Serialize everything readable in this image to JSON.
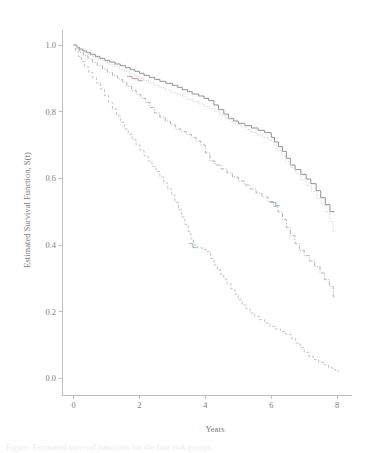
{
  "figure": {
    "background_color": "#ffffff",
    "axis_color": "#b9b9b9",
    "text_color": "#7a7a7a"
  },
  "caption": {
    "partial_text": "Figure. Estimated survival functions for the four risk groups."
  },
  "chart_data": {
    "type": "line",
    "title": "",
    "subtitle": "",
    "xlabel": "Years",
    "ylabel": "Estimated Survival Function, S(t)",
    "xlim": [
      -0.35,
      8.45
    ],
    "ylim": [
      -0.035,
      1.045
    ],
    "xticks": [
      0,
      2,
      4,
      6,
      8
    ],
    "xticklabels": [
      "0",
      "2",
      "4",
      "6",
      "8"
    ],
    "yticks": [
      0.0,
      0.2,
      0.4,
      0.6,
      0.8,
      1.0
    ],
    "yticklabels": [
      "0.0",
      "0.2",
      "0.4",
      "0.6",
      "0.8",
      "1.0"
    ],
    "grid": false,
    "legend": "none",
    "series": [
      {
        "name": "Group 1 (lowest risk)",
        "style": "solid",
        "color": "#8c8c8c",
        "width": 0.95,
        "dasharray": "none",
        "final_value": 0.5,
        "points": [
          [
            0.0,
            1.0
          ],
          [
            0.1,
            0.993
          ],
          [
            0.18,
            0.988
          ],
          [
            0.28,
            0.982
          ],
          [
            0.4,
            0.977
          ],
          [
            0.52,
            0.972
          ],
          [
            0.66,
            0.966
          ],
          [
            0.8,
            0.96
          ],
          [
            0.95,
            0.954
          ],
          [
            1.1,
            0.949
          ],
          [
            1.26,
            0.943
          ],
          [
            1.42,
            0.938
          ],
          [
            1.58,
            0.932
          ],
          [
            1.72,
            0.926
          ],
          [
            1.86,
            0.921
          ],
          [
            2.0,
            0.915
          ],
          [
            2.14,
            0.909
          ],
          [
            2.3,
            0.903
          ],
          [
            2.46,
            0.897
          ],
          [
            2.62,
            0.891
          ],
          [
            2.8,
            0.885
          ],
          [
            3.0,
            0.879
          ],
          [
            3.16,
            0.873
          ],
          [
            3.3,
            0.866
          ],
          [
            3.46,
            0.86
          ],
          [
            3.6,
            0.853
          ],
          [
            3.8,
            0.847
          ],
          [
            3.96,
            0.84
          ],
          [
            4.1,
            0.833
          ],
          [
            4.26,
            0.82
          ],
          [
            4.4,
            0.806
          ],
          [
            4.56,
            0.793
          ],
          [
            4.7,
            0.779
          ],
          [
            4.86,
            0.772
          ],
          [
            5.0,
            0.765
          ],
          [
            5.2,
            0.758
          ],
          [
            5.4,
            0.751
          ],
          [
            5.6,
            0.744
          ],
          [
            5.8,
            0.737
          ],
          [
            6.0,
            0.723
          ],
          [
            6.1,
            0.709
          ],
          [
            6.22,
            0.695
          ],
          [
            6.34,
            0.681
          ],
          [
            6.46,
            0.66
          ],
          [
            6.58,
            0.64
          ],
          [
            6.72,
            0.626
          ],
          [
            6.9,
            0.612
          ],
          [
            7.06,
            0.598
          ],
          [
            7.2,
            0.584
          ],
          [
            7.36,
            0.563
          ],
          [
            7.5,
            0.542
          ],
          [
            7.64,
            0.521
          ],
          [
            7.78,
            0.5
          ],
          [
            7.92,
            0.5
          ]
        ]
      },
      {
        "name": "Group 2",
        "style": "dotted",
        "color": "#cfcfcf",
        "width": 0.95,
        "dasharray": "1.1 1.3",
        "final_value": 0.44,
        "points": [
          [
            0.0,
            1.0
          ],
          [
            0.1,
            0.991
          ],
          [
            0.2,
            0.984
          ],
          [
            0.32,
            0.977
          ],
          [
            0.46,
            0.97
          ],
          [
            0.6,
            0.963
          ],
          [
            0.76,
            0.956
          ],
          [
            0.92,
            0.949
          ],
          [
            1.08,
            0.942
          ],
          [
            1.24,
            0.935
          ],
          [
            1.4,
            0.928
          ],
          [
            1.56,
            0.921
          ],
          [
            1.7,
            0.914
          ],
          [
            1.84,
            0.907
          ],
          [
            1.98,
            0.9
          ],
          [
            2.12,
            0.893
          ],
          [
            2.28,
            0.886
          ],
          [
            2.44,
            0.879
          ],
          [
            2.6,
            0.872
          ],
          [
            2.78,
            0.865
          ],
          [
            2.96,
            0.858
          ],
          [
            3.14,
            0.851
          ],
          [
            3.3,
            0.844
          ],
          [
            3.46,
            0.837
          ],
          [
            3.62,
            0.83
          ],
          [
            3.8,
            0.823
          ],
          [
            3.96,
            0.816
          ],
          [
            4.12,
            0.809
          ],
          [
            4.28,
            0.8
          ],
          [
            4.44,
            0.79
          ],
          [
            4.6,
            0.78
          ],
          [
            4.76,
            0.77
          ],
          [
            4.92,
            0.762
          ],
          [
            5.08,
            0.754
          ],
          [
            5.24,
            0.746
          ],
          [
            5.4,
            0.738
          ],
          [
            5.56,
            0.73
          ],
          [
            5.74,
            0.722
          ],
          [
            5.92,
            0.714
          ],
          [
            6.08,
            0.7
          ],
          [
            6.2,
            0.684
          ],
          [
            6.32,
            0.668
          ],
          [
            6.44,
            0.65
          ],
          [
            6.58,
            0.632
          ],
          [
            6.74,
            0.614
          ],
          [
            6.9,
            0.596
          ],
          [
            7.06,
            0.578
          ],
          [
            7.22,
            0.56
          ],
          [
            7.38,
            0.54
          ],
          [
            7.52,
            0.52
          ],
          [
            7.66,
            0.5
          ],
          [
            7.78,
            0.47
          ],
          [
            7.88,
            0.44
          ],
          [
            7.96,
            0.44
          ]
        ]
      },
      {
        "name": "Group 3",
        "style": "dash-dot",
        "color": "#b0b0b0",
        "width": 0.95,
        "dasharray": "4 1.6 1 1.6",
        "final_value": 0.245,
        "points": [
          [
            0.0,
            1.0
          ],
          [
            0.08,
            0.988
          ],
          [
            0.18,
            0.978
          ],
          [
            0.3,
            0.968
          ],
          [
            0.44,
            0.958
          ],
          [
            0.58,
            0.948
          ],
          [
            0.72,
            0.938
          ],
          [
            0.88,
            0.928
          ],
          [
            1.02,
            0.918
          ],
          [
            1.18,
            0.908
          ],
          [
            1.34,
            0.898
          ],
          [
            1.48,
            0.888
          ],
          [
            1.62,
            0.876
          ],
          [
            1.76,
            0.864
          ],
          [
            1.9,
            0.852
          ],
          [
            2.04,
            0.84
          ],
          [
            2.18,
            0.828
          ],
          [
            2.32,
            0.812
          ],
          [
            2.46,
            0.796
          ],
          [
            2.62,
            0.784
          ],
          [
            2.78,
            0.772
          ],
          [
            2.94,
            0.76
          ],
          [
            3.1,
            0.748
          ],
          [
            3.26,
            0.74
          ],
          [
            3.42,
            0.732
          ],
          [
            3.58,
            0.722
          ],
          [
            3.72,
            0.712
          ],
          [
            3.86,
            0.7
          ],
          [
            4.0,
            0.676
          ],
          [
            4.14,
            0.652
          ],
          [
            4.3,
            0.64
          ],
          [
            4.48,
            0.628
          ],
          [
            4.66,
            0.616
          ],
          [
            4.82,
            0.604
          ],
          [
            5.0,
            0.592
          ],
          [
            5.18,
            0.58
          ],
          [
            5.36,
            0.568
          ],
          [
            5.54,
            0.556
          ],
          [
            5.72,
            0.544
          ],
          [
            5.9,
            0.53
          ],
          [
            6.06,
            0.516
          ],
          [
            6.2,
            0.5
          ],
          [
            6.34,
            0.476
          ],
          [
            6.46,
            0.452
          ],
          [
            6.58,
            0.428
          ],
          [
            6.72,
            0.404
          ],
          [
            6.86,
            0.384
          ],
          [
            7.0,
            0.368
          ],
          [
            7.16,
            0.352
          ],
          [
            7.32,
            0.336
          ],
          [
            7.48,
            0.316
          ],
          [
            7.62,
            0.296
          ],
          [
            7.76,
            0.276
          ],
          [
            7.88,
            0.245
          ],
          [
            7.96,
            0.245
          ]
        ]
      },
      {
        "name": "Group 4 (highest risk)",
        "style": "dashed",
        "color": "#c2c2c2",
        "width": 0.95,
        "dasharray": "3 2",
        "final_value": 0.02,
        "points": [
          [
            0.0,
            1.0
          ],
          [
            0.06,
            0.982
          ],
          [
            0.14,
            0.966
          ],
          [
            0.24,
            0.95
          ],
          [
            0.34,
            0.934
          ],
          [
            0.46,
            0.918
          ],
          [
            0.58,
            0.902
          ],
          [
            0.7,
            0.886
          ],
          [
            0.82,
            0.868
          ],
          [
            0.94,
            0.848
          ],
          [
            1.06,
            0.828
          ],
          [
            1.18,
            0.808
          ],
          [
            1.3,
            0.788
          ],
          [
            1.42,
            0.768
          ],
          [
            1.54,
            0.748
          ],
          [
            1.66,
            0.732
          ],
          [
            1.78,
            0.716
          ],
          [
            1.9,
            0.7
          ],
          [
            2.02,
            0.684
          ],
          [
            2.14,
            0.668
          ],
          [
            2.26,
            0.652
          ],
          [
            2.38,
            0.636
          ],
          [
            2.5,
            0.62
          ],
          [
            2.62,
            0.604
          ],
          [
            2.74,
            0.586
          ],
          [
            2.86,
            0.568
          ],
          [
            2.98,
            0.55
          ],
          [
            3.08,
            0.528
          ],
          [
            3.18,
            0.506
          ],
          [
            3.28,
            0.484
          ],
          [
            3.38,
            0.462
          ],
          [
            3.48,
            0.44
          ],
          [
            3.56,
            0.418
          ],
          [
            3.64,
            0.4
          ],
          [
            3.76,
            0.392
          ],
          [
            3.9,
            0.386
          ],
          [
            4.04,
            0.38
          ],
          [
            4.16,
            0.36
          ],
          [
            4.26,
            0.34
          ],
          [
            4.36,
            0.326
          ],
          [
            4.46,
            0.312
          ],
          [
            4.56,
            0.298
          ],
          [
            4.66,
            0.284
          ],
          [
            4.78,
            0.268
          ],
          [
            4.9,
            0.252
          ],
          [
            5.0,
            0.236
          ],
          [
            5.12,
            0.22
          ],
          [
            5.24,
            0.208
          ],
          [
            5.36,
            0.196
          ],
          [
            5.5,
            0.186
          ],
          [
            5.64,
            0.176
          ],
          [
            5.8,
            0.166
          ],
          [
            5.96,
            0.156
          ],
          [
            6.12,
            0.148
          ],
          [
            6.28,
            0.14
          ],
          [
            6.44,
            0.132
          ],
          [
            6.6,
            0.12
          ],
          [
            6.74,
            0.106
          ],
          [
            6.88,
            0.092
          ],
          [
            7.0,
            0.078
          ],
          [
            7.14,
            0.066
          ],
          [
            7.28,
            0.056
          ],
          [
            7.44,
            0.048
          ],
          [
            7.6,
            0.04
          ],
          [
            7.74,
            0.032
          ],
          [
            7.86,
            0.026
          ],
          [
            7.96,
            0.022
          ],
          [
            8.04,
            0.02
          ]
        ]
      },
      {
        "name": "Group 2 overlap highlight (magenta segment)",
        "style": "solid",
        "color": "#cc8fb8",
        "width": 1.0,
        "dasharray": "none",
        "final_value": null,
        "points": [
          [
            1.62,
            0.906
          ],
          [
            1.78,
            0.906
          ],
          [
            1.78,
            0.899
          ],
          [
            1.96,
            0.899
          ],
          [
            1.96,
            0.893
          ],
          [
            2.1,
            0.893
          ]
        ]
      },
      {
        "name": "Group 3 overlap highlight (teal segment)",
        "style": "solid",
        "color": "#7fb5ad",
        "width": 1.0,
        "dasharray": "none",
        "final_value": null,
        "points": [
          [
            5.96,
            0.528
          ],
          [
            6.14,
            0.528
          ],
          [
            6.14,
            0.518
          ],
          [
            6.26,
            0.518
          ]
        ]
      },
      {
        "name": "Group 4 overlap highlight (teal segment)",
        "style": "solid",
        "color": "#8fbdb4",
        "width": 1.0,
        "dasharray": "none",
        "final_value": null,
        "points": [
          [
            3.5,
            0.404
          ],
          [
            3.62,
            0.404
          ],
          [
            3.62,
            0.392
          ],
          [
            3.74,
            0.392
          ]
        ]
      }
    ]
  },
  "layout": {
    "plot_left_px": 62,
    "plot_right_px": 352,
    "plot_top_px": 30,
    "plot_bottom_px": 390,
    "x_axis_y_px": 395,
    "y_axis_x_px": 62
  }
}
